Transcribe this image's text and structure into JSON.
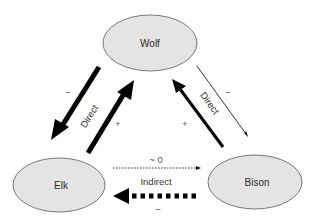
{
  "diagram": {
    "type": "species-interaction-network",
    "nodes": [
      {
        "id": "wolf",
        "label": "Wolf"
      },
      {
        "id": "elk",
        "label": "Elk"
      },
      {
        "id": "bison",
        "label": "Bison"
      }
    ],
    "edges": [
      {
        "from": "Wolf",
        "to": "Elk",
        "type": "Direct",
        "sign": "–",
        "style": "thick-solid"
      },
      {
        "from": "Elk",
        "to": "Wolf",
        "type": "Direct",
        "sign": "+",
        "style": "thick-solid"
      },
      {
        "from": "Bison",
        "to": "Wolf",
        "type": "Direct",
        "sign": "+",
        "style": "thick-solid"
      },
      {
        "from": "Wolf",
        "to": "Bison",
        "type": "Direct",
        "sign": "–",
        "style": "thin-solid"
      },
      {
        "from": "Elk",
        "to": "Bison",
        "type": "Indirect",
        "sign": "~ 0",
        "style": "thin-dotted"
      },
      {
        "from": "Bison",
        "to": "Elk",
        "type": "Indirect",
        "sign": "–",
        "style": "thick-dotted"
      }
    ],
    "labels": {
      "left_direct": "Direct",
      "right_direct": "Direct",
      "indirect": "Indirect",
      "sign_wolf_elk": "–",
      "sign_elk_wolf": "+",
      "sign_bison_wolf": "+",
      "sign_wolf_bison": "–",
      "sign_elk_bison": "~ 0",
      "sign_bison_elk": "–"
    },
    "colors": {
      "node_fill": "#e4e4e4",
      "node_stroke": "#5a5a5a",
      "arrow": "#000000"
    }
  }
}
